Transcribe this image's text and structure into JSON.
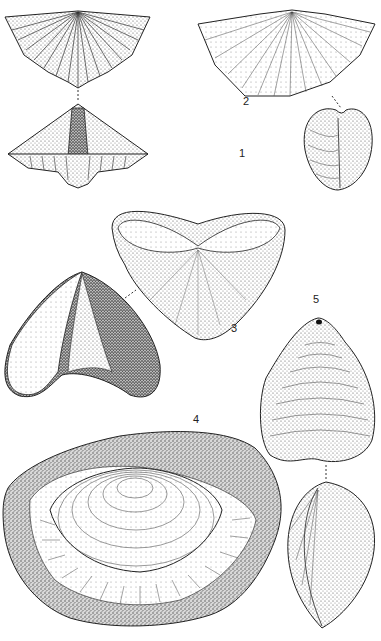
{
  "plate": {
    "background": "#ffffff",
    "ink": "#1a1a1a",
    "figures": [
      {
        "id": 1,
        "label": "1",
        "description": "spiriferid brachiopod, dorsal view and posterior view with interarea, plicate"
      },
      {
        "id": 2,
        "label": "2",
        "description": "wide-hinged costellate brachiopod, dorsal view and lateral view"
      },
      {
        "id": 3,
        "label": "3",
        "description": "ventral valve interior view and oblique lateral view"
      },
      {
        "id": 4,
        "label": "4",
        "description": "concentric-lamellose brachiopod on rock matrix"
      },
      {
        "id": 5,
        "label": "5",
        "description": "rounded brachiopod with pedicle foramen, dorsal and lateral views"
      }
    ],
    "labels": {
      "fig1": "1",
      "fig2": "2",
      "fig3": "3",
      "fig4": "4",
      "fig5": "5"
    }
  }
}
